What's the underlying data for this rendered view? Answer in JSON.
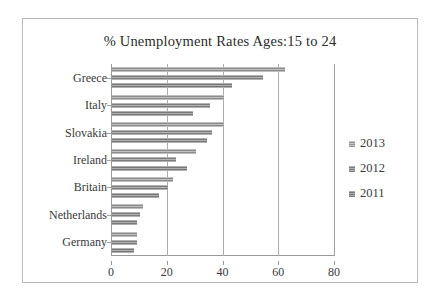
{
  "chart_data": {
    "type": "bar",
    "orientation": "horizontal",
    "title": "% Unemployment Rates Ages:15 to 24",
    "xlabel": "",
    "ylabel": "",
    "categories": [
      "Greece",
      "Italy",
      "Slovakia",
      "Ireland",
      "Britain",
      "Netherlands",
      "Germany"
    ],
    "series": [
      {
        "name": "2013",
        "values": [
          62,
          40,
          40,
          30,
          22,
          11,
          9
        ]
      },
      {
        "name": "2012",
        "values": [
          54,
          35,
          36,
          23,
          20,
          10,
          9
        ]
      },
      {
        "name": "2011",
        "values": [
          43,
          29,
          34,
          27,
          17,
          9,
          8
        ]
      }
    ],
    "xlim": [
      0,
      80
    ],
    "xticks": [
      0,
      20,
      40,
      60,
      80
    ],
    "xticklabels": [
      "0",
      "20",
      "40",
      "60",
      "80"
    ],
    "grid": "vertical",
    "legend_position": "right",
    "legend_entries": [
      "2013",
      "2012",
      "2011"
    ],
    "colors": {
      "series_2013": "#9c9c9c",
      "series_2012": "#8a8a8a",
      "series_2011": "#868686",
      "axis": "#9a9a9a",
      "gridline": "#adadad",
      "text": "#3a3a3a",
      "frame": "#b9b9b9",
      "background": "#ffffff"
    }
  }
}
